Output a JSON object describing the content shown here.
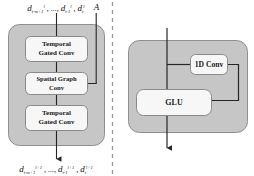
{
  "figure": {
    "type": "neural-network-block-diagram",
    "panels": [
      "spatio-temporal-block",
      "temporal-gated-conv-detail"
    ],
    "colors": {
      "panel_fill": "#c6c6c6",
      "panel_stroke": "#8f8f8f",
      "box_fill": "#f7f7f7",
      "box_stroke": "#8a8a8a",
      "arrow": "#262626",
      "divider": "#9a9a9a"
    }
  },
  "left_panel": {
    "name": "spatio-temporal-conv-block",
    "input_label": {
      "terms": "d , ..., d , d",
      "full": "d^l_{t-m+1} , ..., d^l_{t-1} , d^l_t",
      "var": "d",
      "sub_first": "t-m+1",
      "sub_second": "t-1",
      "sub_third": "t",
      "sup": "l",
      "ellipsis": "...",
      "comma": ","
    },
    "adjacency_label": "A",
    "output_label": {
      "full": "d^{l+1}_{t-m+1} , ..., d^{l+1}_{t-1} , d^{l+1}_t",
      "var": "d",
      "sub_first": "t-m+1",
      "sub_second": "t-1",
      "sub_third": "t",
      "sup": "l+1",
      "ellipsis": "...",
      "comma": ","
    },
    "blocks": [
      {
        "id": "temporal-gated-conv-top",
        "line1": "Temporal",
        "line2": "Gated Conv"
      },
      {
        "id": "spatial-graph-conv",
        "line1": "Spatial Graph",
        "line2": "Conv"
      },
      {
        "id": "temporal-gated-conv-bottom",
        "line1": "Temporal",
        "line2": "Gated Conv"
      }
    ]
  },
  "right_panel": {
    "name": "temporal-gated-conv-detail",
    "blocks": [
      {
        "id": "one-d-conv",
        "label": "1D Conv"
      },
      {
        "id": "glu",
        "label": "GLU"
      }
    ]
  }
}
